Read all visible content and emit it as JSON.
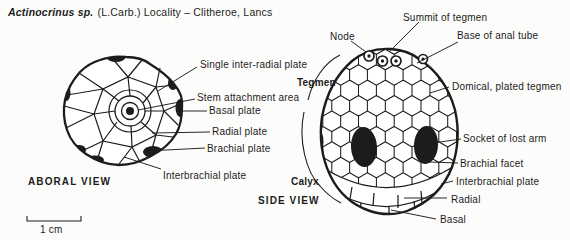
{
  "title": {
    "species": "Actinocrinus sp.",
    "rest": "(L.Carb.) Locality – Clitheroe, Lancs"
  },
  "page_header_fragment": {
    "text": "Echinoderms",
    "page_number": "7"
  },
  "aboral_view": {
    "caption": "ABORAL VIEW",
    "labels": [
      "Single inter-radial plate",
      "Stem attachment area",
      "Basal plate",
      "Radial plate",
      "Brachial plate",
      "Interbrachial plate"
    ]
  },
  "side_view": {
    "caption": "SIDE VIEW",
    "region_tegmen": "Tegmen",
    "region_calyx": "Calyx",
    "labels": [
      "Summit of tegmen",
      "Node",
      "Base of anal tube",
      "Domical, plated tegmen",
      "Socket of lost arm",
      "Brachial facet",
      "Interbrachial plate",
      "Radial",
      "Basal"
    ]
  },
  "scale_bar": {
    "label": "1 cm"
  },
  "colors": {
    "ink": "#1c1c1c",
    "background": "#fcfcfb"
  }
}
